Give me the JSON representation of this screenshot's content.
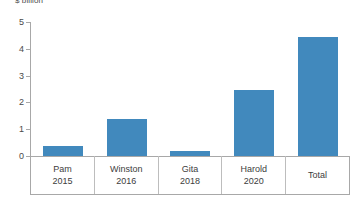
{
  "chart_data": {
    "type": "bar",
    "title": "",
    "ylabel": "$ billion",
    "xlabel": "",
    "categories": [
      "Pam",
      "Winston",
      "Gita",
      "Harold",
      "Total"
    ],
    "category_years": [
      "2015",
      "2016",
      "2018",
      "2020",
      ""
    ],
    "values": [
      0.37,
      1.38,
      0.19,
      2.46,
      4.44
    ],
    "ylim": [
      0,
      5
    ],
    "yticks": [
      0,
      1,
      2,
      3,
      4,
      5
    ],
    "ytick_labels": [
      "0",
      "1",
      "2",
      "3",
      "4",
      "5"
    ],
    "grid": false,
    "legend": null,
    "series": [
      {
        "name": "$ billion",
        "color": "#4189bd",
        "values": [
          0.37,
          1.38,
          0.19,
          2.46,
          4.44
        ]
      }
    ]
  },
  "colors": {
    "bar": "#4189bd",
    "axis": "#a8a8a8",
    "text": "#3d3d3d",
    "separator": "#bdbdbd",
    "background": "#ffffff"
  }
}
